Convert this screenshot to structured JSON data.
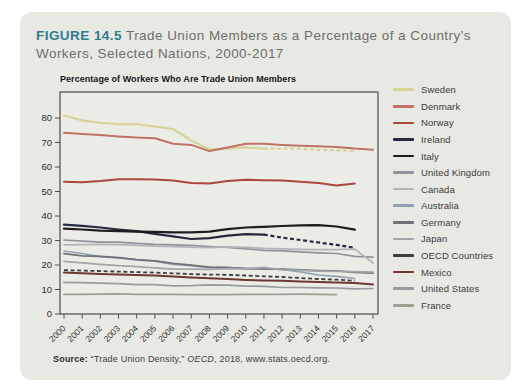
{
  "figure": {
    "label": "FIGURE 14.5",
    "title_rest": " Trade Union Members as a Percentage of a Country's Workers, Selected Nations, 2000-2017",
    "accent_color": "#2f7d8e",
    "card_bg": "#e9e9e4"
  },
  "source": {
    "label": "Source:",
    "before_italic": " “Trade Union Density,” ",
    "italic": "OECD",
    "after_italic": ", 2018, www.stats.oecd.org."
  },
  "chart_data": {
    "type": "line",
    "title": "Percentage of Workers Who Are Trade Union Members",
    "x": [
      "2000",
      "2001",
      "2002",
      "2003",
      "2004",
      "2005",
      "2006",
      "2007",
      "2008",
      "2009",
      "2010",
      "2011",
      "2012",
      "2013",
      "2014",
      "2015",
      "2016",
      "2017"
    ],
    "y_ticks": [
      0,
      10,
      20,
      30,
      40,
      50,
      60,
      70,
      80
    ],
    "ylim": [
      0,
      85
    ],
    "grid": false,
    "legend_position": "right",
    "axis_color": "#4c4c4c",
    "plot_bg": "#ececE7",
    "series": [
      {
        "name": "Sweden",
        "color": "#d6d39b",
        "width": 2.2,
        "dash_from_year": 2011,
        "values": [
          81,
          79,
          78,
          77.5,
          77.5,
          76.5,
          75.5,
          70.8,
          67.2,
          67.5,
          68,
          67.5,
          67.5,
          67.5,
          67,
          66.8,
          66.5,
          null
        ]
      },
      {
        "name": "Denmark",
        "color": "#bf7265",
        "width": 2.0,
        "dash_from_year": null,
        "values": [
          74,
          73.5,
          73,
          72.5,
          72,
          71.7,
          69.5,
          69,
          66.5,
          68,
          69.5,
          69.5,
          69,
          68.7,
          68.5,
          68.2,
          67.5,
          67
        ]
      },
      {
        "name": "Norway",
        "color": "#ac453d",
        "width": 2.0,
        "dash_from_year": null,
        "values": [
          54,
          53.8,
          54.3,
          55,
          55,
          54.9,
          54.5,
          53.5,
          53.3,
          54.3,
          54.8,
          54.6,
          54.5,
          54,
          53.5,
          52.5,
          53.3,
          null
        ]
      },
      {
        "name": "Ireland",
        "color": "#252a3f",
        "width": 2.2,
        "dash_from_year": 2011,
        "values": [
          36.5,
          36,
          35.3,
          34.5,
          33.8,
          32.7,
          31.7,
          30.6,
          31,
          32,
          32.6,
          32.4,
          31.2,
          30.2,
          29.2,
          28.2,
          27,
          null
        ]
      },
      {
        "name": "Italy",
        "color": "#1d1d1d",
        "width": 2.2,
        "dash_from_year": null,
        "values": [
          34.8,
          34.5,
          34,
          33.8,
          33.6,
          33.5,
          33.3,
          33.3,
          33.6,
          34.6,
          35.3,
          35.6,
          35.9,
          36.2,
          36.3,
          35.7,
          34.4,
          null
        ]
      },
      {
        "name": "United Kingdom",
        "color": "#8f9499",
        "width": 1.7,
        "dash_from_year": null,
        "values": [
          30.2,
          29.7,
          29.3,
          29.3,
          28.8,
          28.4,
          28.2,
          28,
          27.5,
          27.2,
          26.6,
          26,
          25.8,
          25.4,
          25,
          24.7,
          23.5,
          23.2
        ]
      },
      {
        "name": "Canada",
        "color": "#b2b5b7",
        "width": 1.7,
        "dash_from_year": null,
        "values": [
          28.2,
          28.3,
          28.4,
          28.3,
          28,
          27.7,
          27.5,
          27.3,
          27.1,
          27.4,
          27.2,
          26.8,
          26.6,
          26.4,
          26.3,
          26.3,
          26.5,
          20.8
        ]
      },
      {
        "name": "Australia",
        "color": "#93a2b3",
        "width": 1.7,
        "dash_from_year": null,
        "values": [
          25.7,
          24.7,
          23.4,
          22.9,
          22.1,
          21.6,
          20.3,
          19.7,
          18.9,
          19,
          18.4,
          18.5,
          18.2,
          17.2,
          15.9,
          15.4,
          14.5,
          null
        ]
      },
      {
        "name": "Germany",
        "color": "#6f7377",
        "width": 1.7,
        "dash_from_year": null,
        "values": [
          24.6,
          23.7,
          23.5,
          23,
          22.2,
          21.7,
          20.7,
          19.9,
          19.1,
          18.9,
          18.6,
          18.4,
          18.3,
          18,
          17.7,
          17.6,
          17,
          16.7
        ]
      },
      {
        "name": "Japan",
        "color": "#a2a6a9",
        "width": 1.7,
        "dash_from_year": null,
        "values": [
          21.5,
          20.9,
          20.3,
          19.7,
          19.3,
          18.8,
          18.3,
          18.3,
          18.2,
          18.5,
          18.4,
          19,
          18,
          17.8,
          17.5,
          17.4,
          17.3,
          17.1
        ]
      },
      {
        "name": "OECD Countries",
        "color": "#3e3e3e",
        "width": 1.8,
        "dash_from_year": 2000,
        "values": [
          17.9,
          17.7,
          17.5,
          17.3,
          17.1,
          16.9,
          16.6,
          16.3,
          16.1,
          16,
          15.7,
          15.4,
          15.1,
          14.7,
          14.3,
          14,
          13.6,
          null
        ]
      },
      {
        "name": "Mexico",
        "color": "#6d3831",
        "width": 2.0,
        "dash_from_year": null,
        "values": [
          16.9,
          16.6,
          16.3,
          16.1,
          15.9,
          15.7,
          15.3,
          14.9,
          14.6,
          14.3,
          13.9,
          13.7,
          13.6,
          13.3,
          13.1,
          12.9,
          12.6,
          12.1
        ]
      },
      {
        "name": "United States",
        "color": "#979b9e",
        "width": 1.7,
        "dash_from_year": null,
        "values": [
          12.9,
          12.8,
          12.6,
          12.4,
          12,
          12,
          11.5,
          11.6,
          11.9,
          11.8,
          11.4,
          11.3,
          10.8,
          10.8,
          10.7,
          10.6,
          10.3,
          10.4
        ]
      },
      {
        "name": "France",
        "color": "#9aa190",
        "width": 1.7,
        "dash_from_year": null,
        "values": [
          8,
          8,
          8.1,
          8.2,
          8,
          8,
          8,
          7.9,
          7.9,
          7.9,
          8,
          8,
          8,
          8.1,
          8,
          7.9,
          null,
          null
        ]
      }
    ]
  }
}
